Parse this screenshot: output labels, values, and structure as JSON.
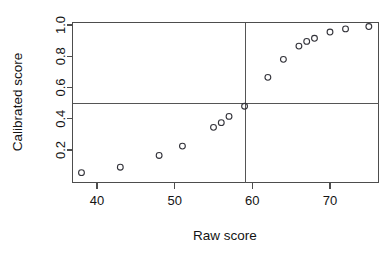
{
  "chart_data": {
    "type": "scatter",
    "title": "",
    "xlabel": "Raw score",
    "ylabel": "Calibrated score",
    "xlim": [
      36.8,
      76.2
    ],
    "ylim": [
      0.02,
      1.03
    ],
    "xticks": [
      40,
      50,
      60,
      70
    ],
    "xtick_labels": [
      "40",
      "50",
      "60",
      "70"
    ],
    "yticks": [
      0.2,
      0.4,
      0.6,
      0.8,
      1.0
    ],
    "ytick_labels": [
      "0.2",
      "0.4",
      "0.6",
      "0.8",
      "1.0"
    ],
    "grid": false,
    "legend": false,
    "marker": "open-circle",
    "x": [
      38,
      43,
      48,
      51,
      55,
      56,
      57,
      59,
      62,
      64,
      66,
      67,
      68,
      70,
      72,
      75
    ],
    "y": [
      0.055,
      0.09,
      0.165,
      0.225,
      0.345,
      0.375,
      0.415,
      0.48,
      0.665,
      0.78,
      0.865,
      0.895,
      0.915,
      0.955,
      0.975,
      0.99
    ],
    "points": [
      {
        "x": 38,
        "y": 0.055
      },
      {
        "x": 43,
        "y": 0.09
      },
      {
        "x": 48,
        "y": 0.165
      },
      {
        "x": 51,
        "y": 0.225
      },
      {
        "x": 55,
        "y": 0.345
      },
      {
        "x": 56,
        "y": 0.375
      },
      {
        "x": 57,
        "y": 0.415
      },
      {
        "x": 59,
        "y": 0.48
      },
      {
        "x": 62,
        "y": 0.665
      },
      {
        "x": 64,
        "y": 0.78
      },
      {
        "x": 66,
        "y": 0.865
      },
      {
        "x": 67,
        "y": 0.895
      },
      {
        "x": 68,
        "y": 0.915
      },
      {
        "x": 70,
        "y": 0.955
      },
      {
        "x": 72,
        "y": 0.975
      },
      {
        "x": 75,
        "y": 0.99
      }
    ],
    "reference_lines": [
      {
        "orientation": "vertical",
        "value": 59.1,
        "label": "cut-score"
      },
      {
        "orientation": "horizontal",
        "value": 0.5,
        "label": "0.5 probability"
      }
    ],
    "colors": {
      "marker_stroke": "#33333a",
      "axis": "#4d4d4d",
      "reference": "#555555",
      "background": "#ffffff",
      "text": "#141414"
    }
  }
}
